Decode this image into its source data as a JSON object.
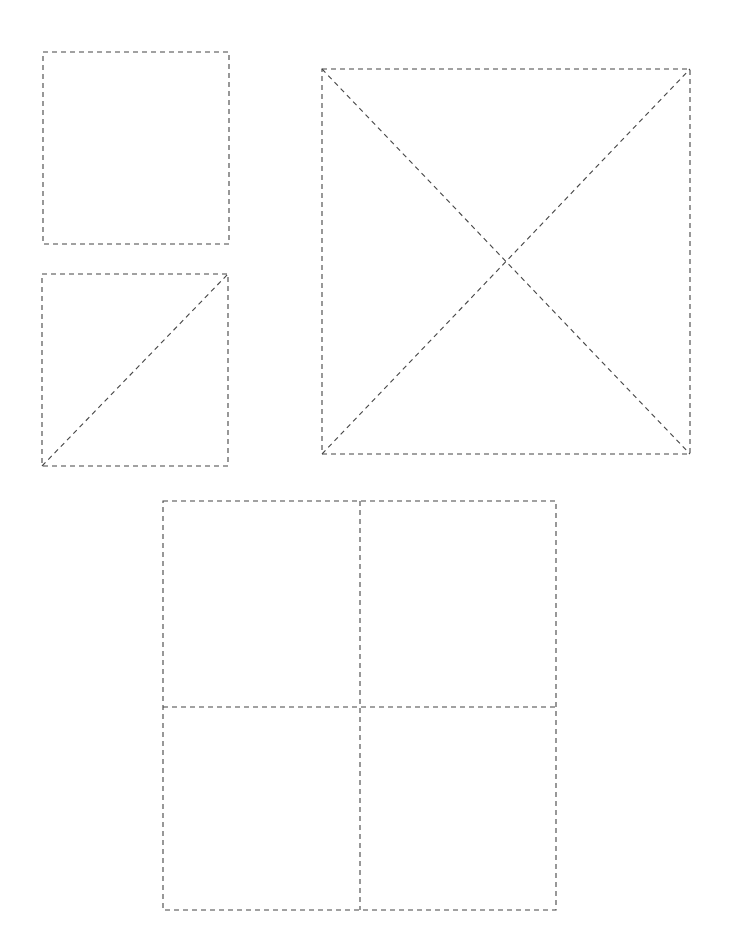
{
  "canvas": {
    "width": 732,
    "height": 944,
    "background": "#ffffff",
    "line_color": "#444444"
  },
  "shapes": [
    {
      "id": "plain-square",
      "x": 43,
      "y": 52,
      "w": 186,
      "h": 192,
      "inner_lines": []
    },
    {
      "id": "square-single-diagonal",
      "x": 42,
      "y": 274,
      "w": 186,
      "h": 192,
      "inner_lines": [
        "diagonal-bottom-left-to-top-right"
      ]
    },
    {
      "id": "square-both-diagonals",
      "x": 322,
      "y": 69,
      "w": 368,
      "h": 385,
      "inner_lines": [
        "diagonal-top-left-to-bottom-right",
        "diagonal-bottom-left-to-top-right"
      ]
    },
    {
      "id": "square-quartered",
      "x": 163,
      "y": 501,
      "w": 393,
      "h": 409,
      "inner_lines": [
        "vertical-midline",
        "horizontal-midline"
      ]
    }
  ]
}
